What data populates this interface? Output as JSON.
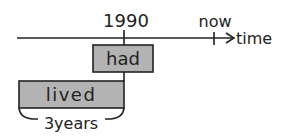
{
  "diagram": {
    "type": "tense-timeline",
    "axis": {
      "label": "time"
    },
    "markers": [
      {
        "id": "1990",
        "label": "1990"
      },
      {
        "id": "now",
        "label": "now"
      }
    ],
    "boxes": [
      {
        "id": "had",
        "label": "had"
      },
      {
        "id": "lived",
        "label": "lived"
      }
    ],
    "duration": {
      "label": "3years"
    },
    "colors": {
      "box_fill": "#b3b3b3",
      "line": "#222222"
    }
  }
}
